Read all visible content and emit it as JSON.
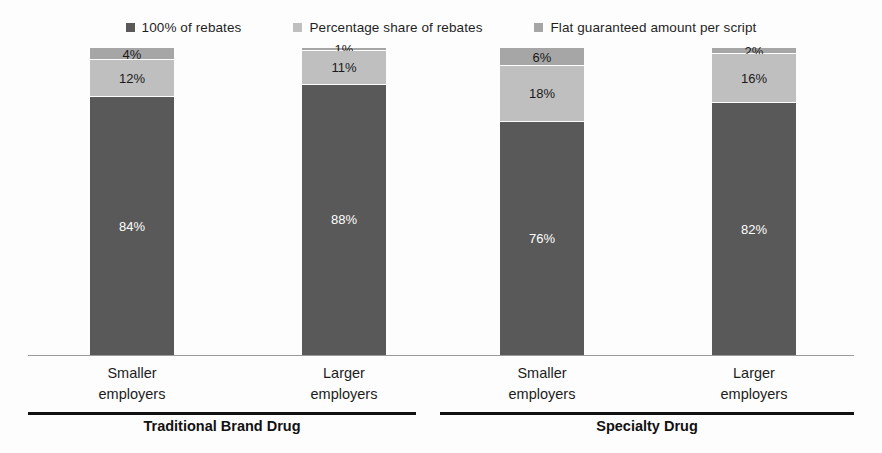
{
  "chart_data": {
    "type": "bar",
    "stacked": true,
    "stack_mode": "percent",
    "title": "",
    "subtitle": "",
    "xlabel": "",
    "ylabel": "",
    "ylim": [
      0,
      100
    ],
    "grid": false,
    "legend_position": "top",
    "categories": [
      "Smaller employers",
      "Larger employers",
      "Smaller employers",
      "Larger employers"
    ],
    "groups": [
      {
        "label": "Traditional Brand Drug",
        "categories": [
          "Smaller employers",
          "Larger employers"
        ]
      },
      {
        "label": "Specialty Drug",
        "categories": [
          "Smaller employers",
          "Larger employers"
        ]
      }
    ],
    "series": [
      {
        "name": "100% of rebates",
        "color": "#595959",
        "values": [
          84,
          88,
          76,
          82
        ]
      },
      {
        "name": "Percentage share of rebates",
        "color": "#bfbfbf",
        "values": [
          12,
          11,
          18,
          16
        ]
      },
      {
        "name": "Flat guaranteed amount per script",
        "color": "#a6a6a6",
        "values": [
          4,
          1,
          6,
          2
        ]
      }
    ],
    "bars": [
      {
        "group": "Traditional Brand Drug",
        "category": "Smaller employers",
        "segments": [
          {
            "series": "Flat guaranteed amount per script",
            "value": 4,
            "label": "4%"
          },
          {
            "series": "Percentage share of rebates",
            "value": 12,
            "label": "12%"
          },
          {
            "series": "100% of rebates",
            "value": 84,
            "label": "84%"
          }
        ]
      },
      {
        "group": "Traditional Brand Drug",
        "category": "Larger employers",
        "segments": [
          {
            "series": "Flat guaranteed amount per script",
            "value": 1,
            "label": "1%"
          },
          {
            "series": "Percentage share of rebates",
            "value": 11,
            "label": "11%"
          },
          {
            "series": "100% of rebates",
            "value": 88,
            "label": "88%"
          }
        ]
      },
      {
        "group": "Specialty Drug",
        "category": "Smaller employers",
        "segments": [
          {
            "series": "Flat guaranteed amount per script",
            "value": 6,
            "label": "6%"
          },
          {
            "series": "Percentage share of rebates",
            "value": 18,
            "label": "18%"
          },
          {
            "series": "100% of rebates",
            "value": 76,
            "label": "76%"
          }
        ]
      },
      {
        "group": "Specialty Drug",
        "category": "Larger employers",
        "segments": [
          {
            "series": "Flat guaranteed amount per script",
            "value": 2,
            "label": "2%"
          },
          {
            "series": "Percentage share of rebates",
            "value": 16,
            "label": "16%"
          },
          {
            "series": "100% of rebates",
            "value": 82,
            "label": "82%"
          }
        ]
      }
    ]
  },
  "legend": {
    "items": [
      {
        "label": "100% of rebates",
        "color": "#595959"
      },
      {
        "label": "Percentage share of rebates",
        "color": "#bfbfbf"
      },
      {
        "label": "Flat guaranteed amount per script",
        "color": "#a6a6a6"
      }
    ]
  },
  "bars": [
    {
      "cat_line1": "Smaller",
      "cat_line2": "employers",
      "top": {
        "label": "4%",
        "pct": 4,
        "color": "#a6a6a6"
      },
      "mid": {
        "label": "12%",
        "pct": 12,
        "color": "#bfbfbf"
      },
      "bot": {
        "label": "84%",
        "pct": 84,
        "color": "#595959"
      }
    },
    {
      "cat_line1": "Larger",
      "cat_line2": "employers",
      "top": {
        "label": "1%",
        "pct": 1,
        "color": "#a6a6a6"
      },
      "mid": {
        "label": "11%",
        "pct": 11,
        "color": "#bfbfbf"
      },
      "bot": {
        "label": "88%",
        "pct": 88,
        "color": "#595959"
      }
    },
    {
      "cat_line1": "Smaller",
      "cat_line2": "employers",
      "top": {
        "label": "6%",
        "pct": 6,
        "color": "#a6a6a6"
      },
      "mid": {
        "label": "18%",
        "pct": 18,
        "color": "#bfbfbf"
      },
      "bot": {
        "label": "76%",
        "pct": 76,
        "color": "#595959"
      }
    },
    {
      "cat_line1": "Larger",
      "cat_line2": "employers",
      "top": {
        "label": "2%",
        "pct": 2,
        "color": "#a6a6a6"
      },
      "mid": {
        "label": "16%",
        "pct": 16,
        "color": "#bfbfbf"
      },
      "bot": {
        "label": "82%",
        "pct": 82,
        "color": "#595959"
      }
    }
  ],
  "groups": [
    {
      "label": "Traditional Brand Drug"
    },
    {
      "label": "Specialty Drug"
    }
  ]
}
